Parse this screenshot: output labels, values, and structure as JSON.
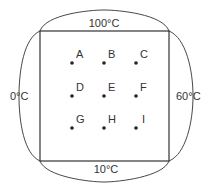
{
  "diagram": {
    "type": "heat-plate-boundary-grid",
    "colors": {
      "line": "#333333",
      "dot": "#222222",
      "background": "#ffffff"
    },
    "boundaries": {
      "top": "100°C",
      "left": "0°C",
      "right": "60°C",
      "bottom": "10°C"
    },
    "points": [
      {
        "label": "A",
        "row": 0,
        "col": 0
      },
      {
        "label": "B",
        "row": 0,
        "col": 1
      },
      {
        "label": "C",
        "row": 0,
        "col": 2
      },
      {
        "label": "D",
        "row": 1,
        "col": 0
      },
      {
        "label": "E",
        "row": 1,
        "col": 1
      },
      {
        "label": "F",
        "row": 1,
        "col": 2
      },
      {
        "label": "G",
        "row": 2,
        "col": 0
      },
      {
        "label": "H",
        "row": 2,
        "col": 1
      },
      {
        "label": "I",
        "row": 2,
        "col": 2
      }
    ]
  }
}
